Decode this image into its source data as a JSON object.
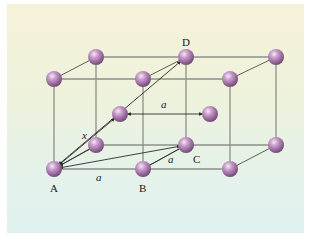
{
  "figure": {
    "colors": {
      "background_top": "#f6f2d8",
      "background_bottom": "#dff2f0",
      "atom": "#b58ab8",
      "atom_highlight": "#f0e0f2",
      "atom_shadow": "#6e4873",
      "edge": "#8c9088",
      "arrow": "#2a2a2a"
    },
    "labels": {
      "A": "A",
      "B": "B",
      "C": "C",
      "D": "D",
      "lattice_constant_bottom": "a",
      "lattice_constant_face": "a",
      "lattice_constant_center": "a",
      "diagonal_x": "x"
    },
    "atoms": [
      {
        "id": "front-bottom-left",
        "label": "A",
        "cx": 54,
        "cy": 169
      },
      {
        "id": "front-bottom-middle",
        "label": "B",
        "cx": 143,
        "cy": 169
      },
      {
        "id": "front-bottom-right",
        "label": "",
        "cx": 230,
        "cy": 169
      },
      {
        "id": "back-bottom-left",
        "label": "",
        "cx": 96,
        "cy": 145
      },
      {
        "id": "back-bottom-middle",
        "label": "C",
        "cx": 186,
        "cy": 145
      },
      {
        "id": "back-bottom-right",
        "label": "",
        "cx": 276,
        "cy": 145
      },
      {
        "id": "front-top-left",
        "label": "",
        "cx": 54,
        "cy": 79
      },
      {
        "id": "front-top-middle",
        "label": "",
        "cx": 143,
        "cy": 79
      },
      {
        "id": "front-top-right",
        "label": "",
        "cx": 230,
        "cy": 79
      },
      {
        "id": "back-top-left",
        "label": "",
        "cx": 96,
        "cy": 57
      },
      {
        "id": "back-top-middle",
        "label": "D",
        "cx": 186,
        "cy": 57
      },
      {
        "id": "back-top-right",
        "label": "",
        "cx": 276,
        "cy": 57
      },
      {
        "id": "body-center-left",
        "label": "",
        "cx": 120,
        "cy": 114
      },
      {
        "id": "body-center-right",
        "label": "",
        "cx": 210,
        "cy": 114
      }
    ]
  }
}
